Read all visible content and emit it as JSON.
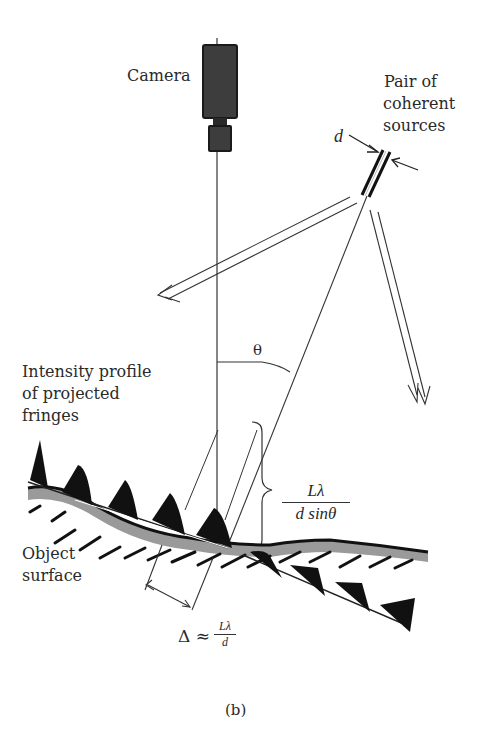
{
  "figure": {
    "labels": {
      "camera": "Camera",
      "sources_line1": "Pair of",
      "sources_line2": "coherent",
      "sources_line3": "sources",
      "d": "d",
      "theta": "θ",
      "intensity_line1": "Intensity profile",
      "intensity_line2": "of projected",
      "intensity_line3": "fringes",
      "object_line1": "Object",
      "object_line2": "surface",
      "fringe_spacing_num": "Lλ",
      "fringe_spacing_den": "d sinθ",
      "delta_prefix": "Δ ≈",
      "delta_num": "Lλ",
      "delta_den": "d",
      "caption": "(b)"
    },
    "colors": {
      "ink": "#1a1a1a",
      "camera_body": "#3a3a3a",
      "surface_shade": "#9a9a9a",
      "background": "#ffffff"
    }
  }
}
